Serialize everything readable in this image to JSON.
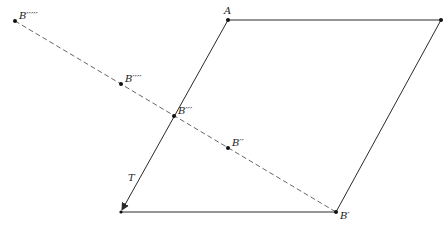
{
  "diagram": {
    "type": "geometric-construction",
    "parallelogram": {
      "vertices": [
        {
          "id": "A",
          "x": 228,
          "y": 20,
          "label": "A"
        },
        {
          "id": "TR",
          "x": 441,
          "y": 20,
          "label": ""
        },
        {
          "id": "Bprime",
          "x": 336,
          "y": 212,
          "label": "B′"
        },
        {
          "id": "BL",
          "x": 121,
          "y": 212,
          "label": ""
        }
      ]
    },
    "vector": {
      "label": "T",
      "from": {
        "x": 228,
        "y": 20
      },
      "to": {
        "x": 121,
        "y": 212
      },
      "label_position": {
        "x": 131,
        "y": 181
      }
    },
    "dashed_line": {
      "from": {
        "x": 15,
        "y": 21
      },
      "to": {
        "x": 336,
        "y": 212
      }
    },
    "points": [
      {
        "id": "B5",
        "label": "B′′′′′",
        "x": 15,
        "y": 21,
        "label_dx": 5,
        "label_dy": -2
      },
      {
        "id": "B4",
        "label": "B′′′′",
        "x": 121,
        "y": 84,
        "label_dx": 5,
        "label_dy": -2
      },
      {
        "id": "B3",
        "label": "B′′′",
        "x": 174,
        "y": 116,
        "label_dx": 4,
        "label_dy": -3
      },
      {
        "id": "B2",
        "label": "B′′",
        "x": 228,
        "y": 148,
        "label_dx": 4,
        "label_dy": -3
      },
      {
        "id": "B1",
        "label": "B′",
        "x": 336,
        "y": 212,
        "label_dx": 4,
        "label_dy": 4
      },
      {
        "id": "A",
        "label": "A",
        "x": 228,
        "y": 20,
        "label_dx": -5,
        "label_dy": -5
      },
      {
        "id": "TR",
        "label": "",
        "x": 441,
        "y": 20,
        "label_dx": 0,
        "label_dy": 0
      }
    ],
    "labels": {
      "A": "A",
      "T": "T",
      "B1": "B′",
      "B2": "B′′",
      "B3": "B′′′",
      "B4": "B′′′′",
      "B5": "B′′′′′"
    },
    "colors": {
      "edge": "#2a2a2a",
      "dashed": "#555555",
      "point": "#111111",
      "background": "#ffffff"
    }
  }
}
